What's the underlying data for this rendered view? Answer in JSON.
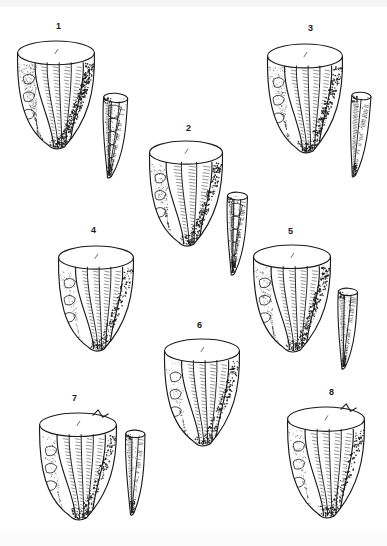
{
  "plate": {
    "title": "Lithic conical cores and bladelets",
    "background_color": "#ffffff",
    "ink_color": "#1a1a1a",
    "width": 387,
    "height": 546,
    "label_font_size": 9
  },
  "figures": [
    {
      "label": "1",
      "label_x": 56,
      "label_y": 22,
      "core": {
        "name": "conical-core-1",
        "x": 16,
        "y": 40,
        "w": 80,
        "h": 113,
        "rim_tilt": -4,
        "flake_scars": 4,
        "stipple_density": "high",
        "shading_side": "right",
        "scar_style": "wide-stepped"
      },
      "blade": {
        "name": "bladelet-1",
        "x": 98,
        "y": 93,
        "w": 30,
        "h": 86,
        "tilt": 4,
        "ridge_count": 2,
        "style": "faceted"
      }
    },
    {
      "label": "2",
      "label_x": 186,
      "label_y": 124,
      "core": {
        "name": "conical-core-2",
        "x": 148,
        "y": 140,
        "w": 76,
        "h": 110,
        "rim_tilt": -3,
        "flake_scars": 3,
        "stipple_density": "medium",
        "shading_side": "right",
        "scar_style": "narrow-ribbed"
      },
      "blade": {
        "name": "bladelet-2",
        "x": 223,
        "y": 192,
        "w": 25,
        "h": 84,
        "tilt": 3,
        "ridge_count": 2,
        "style": "faceted"
      }
    },
    {
      "label": "3",
      "label_x": 308,
      "label_y": 24,
      "core": {
        "name": "conical-core-3",
        "x": 266,
        "y": 43,
        "w": 78,
        "h": 114,
        "rim_tilt": -4,
        "flake_scars": 4,
        "stipple_density": "medium",
        "shading_side": "right",
        "scar_style": "narrow-ribbed"
      },
      "blade": {
        "name": "bladelet-3",
        "x": 346,
        "y": 92,
        "w": 24,
        "h": 86,
        "tilt": 5,
        "ridge_count": 1,
        "style": "plain-ridged"
      }
    },
    {
      "label": "4",
      "label_x": 91,
      "label_y": 226,
      "core": {
        "name": "conical-core-4",
        "x": 57,
        "y": 245,
        "w": 78,
        "h": 110,
        "rim_tilt": -4,
        "flake_scars": 4,
        "stipple_density": "low",
        "shading_side": "right",
        "scar_style": "narrow-ribbed"
      },
      "blade": null
    },
    {
      "label": "5",
      "label_x": 288,
      "label_y": 227,
      "core": {
        "name": "conical-core-5",
        "x": 252,
        "y": 244,
        "w": 80,
        "h": 112,
        "rim_tilt": -5,
        "flake_scars": 4,
        "stipple_density": "medium",
        "shading_side": "right",
        "scar_style": "narrow-ribbed"
      },
      "blade": {
        "name": "bladelet-5",
        "x": 334,
        "y": 288,
        "w": 24,
        "h": 82,
        "tilt": 3,
        "ridge_count": 2,
        "style": "plain-ridged"
      }
    },
    {
      "label": "6",
      "label_x": 197,
      "label_y": 321,
      "core": {
        "name": "conical-core-6",
        "x": 163,
        "y": 338,
        "w": 78,
        "h": 112,
        "rim_tilt": -4,
        "flake_scars": 4,
        "stipple_density": "low",
        "shading_side": "right",
        "scar_style": "narrow-ribbed"
      },
      "blade": null
    },
    {
      "label": "7",
      "label_x": 72,
      "label_y": 394,
      "core": {
        "name": "conical-core-7",
        "x": 38,
        "y": 412,
        "w": 80,
        "h": 112,
        "rim_tilt": -4,
        "flake_scars": 4,
        "stipple_density": "low",
        "shading_side": "right",
        "scar_style": "narrow-ribbed",
        "rim_notch": true
      },
      "blade": {
        "name": "bladelet-7",
        "x": 122,
        "y": 430,
        "w": 24,
        "h": 86,
        "tilt": 2,
        "ridge_count": 2,
        "style": "plain-ridged"
      }
    },
    {
      "label": "8",
      "label_x": 329,
      "label_y": 388,
      "core": {
        "name": "conical-core-8",
        "x": 286,
        "y": 406,
        "w": 80,
        "h": 116,
        "rim_tilt": -5,
        "flake_scars": 4,
        "stipple_density": "low",
        "shading_side": "right",
        "scar_style": "narrow-ribbed",
        "rim_notch": true
      },
      "blade": null
    }
  ]
}
